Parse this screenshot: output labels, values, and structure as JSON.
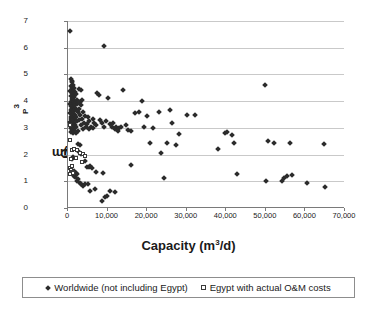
{
  "chart_data": {
    "type": "scatter",
    "title": "",
    "xlabel": "Capacity (m3/d)",
    "ylabel": "Cp ($/m3)",
    "xlim": [
      0,
      70000
    ],
    "ylim": [
      0,
      7
    ],
    "grid": "horizontal",
    "legend_position": "bottom",
    "xticks": [
      "0",
      "10,000",
      "20,000",
      "30,000",
      "40,000",
      "50,000",
      "60,000",
      "70,000"
    ],
    "xtick_values": [
      0,
      10000,
      20000,
      30000,
      40000,
      50000,
      60000,
      70000
    ],
    "yticks": [
      "0",
      "1",
      "2",
      "3",
      "4",
      "5",
      "6",
      "7"
    ],
    "ytick_values": [
      0,
      1,
      2,
      3,
      4,
      5,
      6,
      7
    ],
    "series": [
      {
        "name": "Worldwide (not including Egypt)",
        "marker": "filled-diamond",
        "color": "#2b2b2b",
        "points": [
          [
            500,
            6.62
          ],
          [
            9000,
            6.05
          ],
          [
            700,
            4.82
          ],
          [
            900,
            4.75
          ],
          [
            1100,
            4.7
          ],
          [
            1300,
            4.62
          ],
          [
            800,
            4.55
          ],
          [
            1000,
            4.5
          ],
          [
            1500,
            4.48
          ],
          [
            1200,
            4.42
          ],
          [
            600,
            4.38
          ],
          [
            1700,
            4.35
          ],
          [
            900,
            4.3
          ],
          [
            1400,
            4.28
          ],
          [
            2000,
            4.25
          ],
          [
            1100,
            4.2
          ],
          [
            700,
            4.18
          ],
          [
            1600,
            4.15
          ],
          [
            1300,
            4.1
          ],
          [
            900,
            4.08
          ],
          [
            2200,
            4.05
          ],
          [
            1000,
            4.02
          ],
          [
            1500,
            4.0
          ],
          [
            800,
            3.98
          ],
          [
            1200,
            3.95
          ],
          [
            1800,
            3.92
          ],
          [
            600,
            3.9
          ],
          [
            2400,
            3.88
          ],
          [
            1400,
            3.85
          ],
          [
            1000,
            3.82
          ],
          [
            700,
            3.8
          ],
          [
            1600,
            3.78
          ],
          [
            1100,
            3.75
          ],
          [
            2000,
            3.72
          ],
          [
            900,
            3.7
          ],
          [
            1300,
            3.68
          ],
          [
            800,
            3.65
          ],
          [
            1500,
            3.62
          ],
          [
            2600,
            3.6
          ],
          [
            1000,
            3.58
          ],
          [
            600,
            3.55
          ],
          [
            1200,
            3.52
          ],
          [
            1800,
            3.5
          ],
          [
            900,
            3.48
          ],
          [
            1400,
            3.45
          ],
          [
            700,
            3.42
          ],
          [
            2100,
            3.4
          ],
          [
            1100,
            3.38
          ],
          [
            1600,
            3.35
          ],
          [
            800,
            3.32
          ],
          [
            1300,
            3.3
          ],
          [
            1000,
            3.28
          ],
          [
            2300,
            3.25
          ],
          [
            600,
            3.22
          ],
          [
            1500,
            3.2
          ],
          [
            900,
            3.18
          ],
          [
            1200,
            3.15
          ],
          [
            1700,
            3.12
          ],
          [
            700,
            3.1
          ],
          [
            1400,
            3.08
          ],
          [
            1000,
            3.05
          ],
          [
            2000,
            3.02
          ],
          [
            800,
            3.0
          ],
          [
            1300,
            2.98
          ],
          [
            1100,
            2.95
          ],
          [
            1600,
            2.92
          ],
          [
            900,
            2.9
          ],
          [
            2500,
            2.88
          ],
          [
            700,
            2.85
          ],
          [
            1900,
            2.82
          ],
          [
            1200,
            2.8
          ],
          [
            2800,
            4.45
          ],
          [
            3200,
            4.4
          ],
          [
            3600,
            4.05
          ],
          [
            3000,
            3.95
          ],
          [
            3400,
            3.85
          ],
          [
            2900,
            3.7
          ],
          [
            3800,
            3.6
          ],
          [
            3100,
            3.5
          ],
          [
            4200,
            3.45
          ],
          [
            3500,
            3.35
          ],
          [
            2700,
            3.28
          ],
          [
            4000,
            3.2
          ],
          [
            3300,
            3.1
          ],
          [
            4600,
            3.05
          ],
          [
            3700,
            2.95
          ],
          [
            5000,
            3.4
          ],
          [
            5400,
            3.25
          ],
          [
            4800,
            3.15
          ],
          [
            5800,
            3.05
          ],
          [
            5200,
            2.95
          ],
          [
            6200,
            3.35
          ],
          [
            6600,
            3.2
          ],
          [
            7000,
            3.1
          ],
          [
            6400,
            2.98
          ],
          [
            7400,
            4.3
          ],
          [
            7800,
            4.22
          ],
          [
            8200,
            3.3
          ],
          [
            8600,
            3.18
          ],
          [
            9200,
            3.05
          ],
          [
            9600,
            3.25
          ],
          [
            10200,
            4.1
          ],
          [
            10600,
            3.15
          ],
          [
            11000,
            3.02
          ],
          [
            11400,
            3.2
          ],
          [
            11800,
            2.95
          ],
          [
            12200,
            3.05
          ],
          [
            12600,
            2.9
          ],
          [
            13000,
            2.98
          ],
          [
            13400,
            3.02
          ],
          [
            14000,
            4.42
          ],
          [
            14600,
            3.1
          ],
          [
            15200,
            2.92
          ],
          [
            15800,
            2.88
          ],
          [
            2600,
            2.4
          ],
          [
            3000,
            2.35
          ],
          [
            4400,
            1.75
          ],
          [
            4800,
            1.55
          ],
          [
            5200,
            1.52
          ],
          [
            5600,
            1.58
          ],
          [
            6000,
            1.48
          ],
          [
            7200,
            1.35
          ],
          [
            8800,
            1.3
          ],
          [
            16000,
            1.6
          ],
          [
            17000,
            3.55
          ],
          [
            18000,
            3.58
          ],
          [
            18600,
            4.0
          ],
          [
            19200,
            3.02
          ],
          [
            20000,
            3.45
          ],
          [
            20600,
            2.42
          ],
          [
            21400,
            2.98
          ],
          [
            23000,
            3.58
          ],
          [
            23600,
            2.05
          ],
          [
            24200,
            1.12
          ],
          [
            25000,
            2.45
          ],
          [
            25800,
            3.65
          ],
          [
            26400,
            3.18
          ],
          [
            27200,
            2.35
          ],
          [
            28000,
            2.78
          ],
          [
            30000,
            3.48
          ],
          [
            32000,
            3.47
          ],
          [
            37800,
            2.22
          ],
          [
            39600,
            2.82
          ],
          [
            40200,
            2.85
          ],
          [
            41400,
            2.72
          ],
          [
            42000,
            2.42
          ],
          [
            42600,
            1.28
          ],
          [
            49800,
            4.62
          ],
          [
            50000,
            1.0
          ],
          [
            50600,
            2.52
          ],
          [
            52000,
            2.42
          ],
          [
            54000,
            1.0
          ],
          [
            54600,
            1.12
          ],
          [
            55400,
            1.18
          ],
          [
            56200,
            2.45
          ],
          [
            56600,
            1.25
          ],
          [
            60400,
            0.92
          ],
          [
            64800,
            2.4
          ],
          [
            65000,
            0.78
          ],
          [
            3000,
            0.95
          ],
          [
            3400,
            0.88
          ],
          [
            3800,
            0.82
          ],
          [
            4200,
            0.9
          ],
          [
            5000,
            0.88
          ],
          [
            5600,
            0.65
          ],
          [
            6800,
            0.7
          ],
          [
            8600,
            0.25
          ],
          [
            9400,
            0.42
          ],
          [
            9800,
            0.45
          ],
          [
            10600,
            0.65
          ],
          [
            11800,
            0.6
          ],
          [
            2200,
            1.02
          ],
          [
            2600,
            1.08
          ],
          [
            1800,
            1.15
          ],
          [
            1400,
            1.2
          ],
          [
            2000,
            1.32
          ],
          [
            1600,
            1.38
          ],
          [
            2400,
            1.28
          ],
          [
            1000,
            1.85
          ],
          [
            1200,
            1.92
          ],
          [
            2800,
            2.1
          ],
          [
            3200,
            2.02
          ]
        ]
      },
      {
        "name": "Egypt with actual O&M costs",
        "marker": "open-square",
        "color": "#3a3a3a",
        "points": [
          [
            400,
            3.12
          ],
          [
            500,
            2.55
          ],
          [
            900,
            2.18
          ],
          [
            1400,
            2.22
          ],
          [
            2400,
            2.18
          ],
          [
            3000,
            2.05
          ],
          [
            3800,
            2.02
          ],
          [
            4200,
            1.95
          ],
          [
            3600,
            1.72
          ],
          [
            2000,
            1.88
          ],
          [
            700,
            1.82
          ],
          [
            600,
            1.48
          ],
          [
            800,
            1.42
          ],
          [
            1000,
            1.35
          ],
          [
            1200,
            1.3
          ],
          [
            500,
            1.28
          ],
          [
            900,
            1.58
          ]
        ]
      }
    ]
  },
  "axes": {
    "y_label_main": "C",
    "y_label_sub": "P",
    "y_label_mid": " ($/m",
    "y_label_sup": "3",
    "y_label_end": ")",
    "x_label_main": "Capacity (m",
    "x_label_sup": "3",
    "x_label_end": "/d)"
  },
  "legend": {
    "items": [
      {
        "label": "Worldwide (not including Egypt)",
        "marker": "filled-diamond"
      },
      {
        "label": "Egypt with actual O&M costs",
        "marker": "open-square"
      }
    ]
  }
}
